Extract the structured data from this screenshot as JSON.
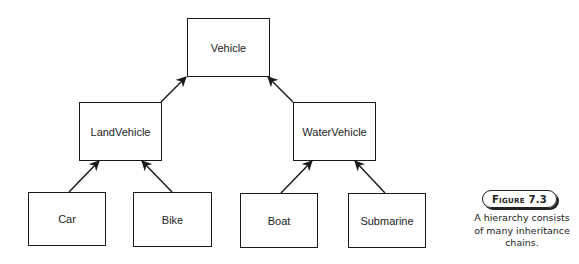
{
  "diagram": {
    "type": "class-hierarchy",
    "nodes": {
      "vehicle": "Vehicle",
      "land_vehicle": "LandVehicle",
      "water_vehicle": "WaterVehicle",
      "car": "Car",
      "bike": "Bike",
      "boat": "Boat",
      "submarine": "Submarine"
    },
    "edges": [
      {
        "from": "LandVehicle",
        "to": "Vehicle"
      },
      {
        "from": "WaterVehicle",
        "to": "Vehicle"
      },
      {
        "from": "Car",
        "to": "LandVehicle"
      },
      {
        "from": "Bike",
        "to": "LandVehicle"
      },
      {
        "from": "Boat",
        "to": "WaterVehicle"
      },
      {
        "from": "Submarine",
        "to": "WaterVehicle"
      }
    ]
  },
  "figure": {
    "label": "Figure 7.3",
    "caption": "A hierarchy consists of many inheritance chains."
  }
}
